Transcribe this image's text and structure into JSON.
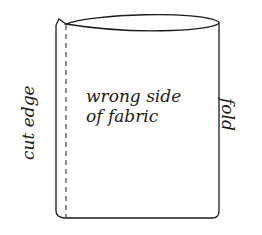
{
  "diagram": {
    "center_label_line1": "wrong side",
    "center_label_line2": "of fabric",
    "left_label": "cut edge",
    "right_label": "fold",
    "stroke_color": "#1a1a1a",
    "background": "#ffffff"
  }
}
